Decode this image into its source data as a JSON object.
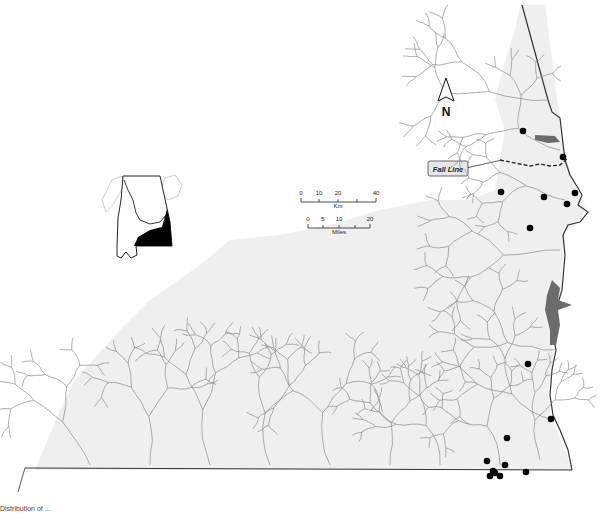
{
  "map": {
    "north_arrow": {
      "label": "N"
    },
    "fall_line_label": "Fall Line",
    "scale_km": {
      "unit": "Km",
      "ticks": [
        "0",
        "10",
        "20",
        "40"
      ]
    },
    "scale_miles": {
      "unit": "Miles",
      "ticks": [
        "0",
        "5",
        "10",
        "20"
      ]
    },
    "inset": {
      "description": "Alabama state outline with highlighted southeastern basin"
    },
    "colors": {
      "basin_fill": "#efefef",
      "river": "#8a8a8a",
      "reservoir": "#6b6b6b",
      "boundary": "#333333",
      "site_marker": "#000000",
      "inset_highlight": "#000000"
    },
    "sites_count": 17
  },
  "caption": {
    "text": "Distribution of ..."
  }
}
